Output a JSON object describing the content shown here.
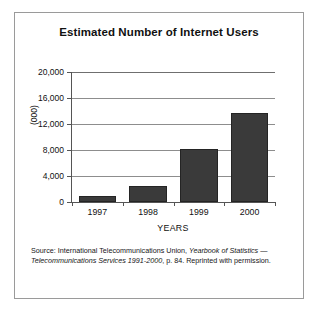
{
  "figure": {
    "title": "Estimated Number of Internet Users",
    "source_note_parts": {
      "lead": "Source: International Telecommunications Union, ",
      "italic_1": "Yearbook of Statistics",
      "mid": " ",
      "italic_2": "— Telecommunications Services 1991-2000",
      "tail": ", p. 84. Reprinted with permission."
    },
    "source_note_full": "Source: International Telecommunications Union, Yearbook of Statistics — Telecommunications Services 1991-2000, p. 84. Reprinted with permission.",
    "colors": {
      "bar_fill": "#3a3a3a",
      "bar_stroke": "#242424",
      "gridline": "#8d8d8d",
      "axis": "#555555",
      "frame_border": "#9a9a9a",
      "text": "#111111",
      "background": "#ffffff"
    }
  },
  "chart_data": {
    "type": "bar",
    "title": "Estimated Number of Internet Users",
    "xlabel": "YEARS",
    "ylabel": "(000)",
    "categories": [
      "1997",
      "1998",
      "1999",
      "2000"
    ],
    "values": [
      900,
      2400,
      8200,
      13700
    ],
    "ylim": [
      0,
      20000
    ],
    "ytick_values": [
      0,
      4000,
      8000,
      12000,
      16000,
      20000
    ],
    "ytick_labels": [
      "0",
      "4,000",
      "8,000",
      "12,000",
      "16,000",
      "20,000"
    ],
    "grid": true,
    "grid_axis": "y",
    "legend": null,
    "legend_position": "none",
    "series": [
      {
        "name": "Internet users (thousands)",
        "values": [
          900,
          2400,
          8200,
          13700
        ]
      }
    ]
  }
}
